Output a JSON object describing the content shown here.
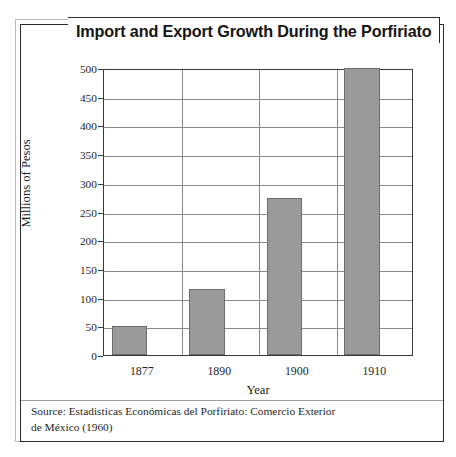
{
  "page_header": {
    "text": "THE PORFIRIATO: ORDER AND PROGRESS"
  },
  "figure": {
    "title": "Import and Export Growth During the Porfiriato",
    "source_line_1": "Source: Estadisticas Económicas del Porfiriato: Comercio Exterior",
    "source_line_2": "de México (1960)"
  },
  "colors": {
    "bar_fill": "#9a9a9a",
    "bar_stroke": "#6d6d6d",
    "gridline": "#8a8a8a",
    "frame": "#2b2b2b"
  },
  "chart_data": {
    "type": "bar",
    "title": "Import and Export Growth During the Porfiriato",
    "xlabel": "Year",
    "ylabel": "Millions of Pesos",
    "categories": [
      "1877",
      "1890",
      "1900",
      "1910"
    ],
    "values": [
      50,
      115,
      273,
      500
    ],
    "ylim": [
      0,
      500
    ],
    "yticks": [
      0,
      50,
      100,
      150,
      200,
      250,
      300,
      350,
      400,
      450,
      500
    ],
    "ytick_labels": [
      "0",
      "50",
      "100",
      "150",
      "200",
      "250",
      "300",
      "350",
      "400",
      "450",
      "500"
    ],
    "grid": true,
    "grid_axis": "both",
    "legend": false,
    "legend_position": "none",
    "series": [
      {
        "name": "Import and Export Value",
        "values": [
          50,
          115,
          273,
          500
        ]
      }
    ]
  }
}
